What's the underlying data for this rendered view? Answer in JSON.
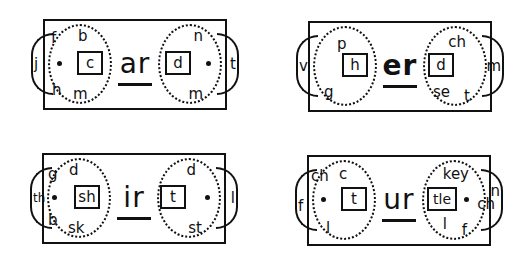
{
  "cards": [
    {
      "vowel": "ar",
      "left_tab": "j",
      "right_tab": "t",
      "left_box": "c",
      "right_box": "d",
      "left_letters": {
        "top_left": "f",
        "top_right": "b",
        "bottom_left": "h",
        "bottom_right": "m"
      },
      "right_letters": {
        "top": "n",
        "bottom": "m"
      }
    },
    {
      "vowel": "er",
      "left_tab": "v",
      "right_tab": "m",
      "left_box": "h",
      "right_box": "d",
      "left_letters": {
        "top": "p",
        "bottom": "g"
      },
      "right_letters": {
        "top": "ch",
        "bottom_left": "se",
        "bottom_right": "t"
      }
    },
    {
      "vowel": "ir",
      "left_tab": "th",
      "right_tab": "l",
      "left_box": "sh",
      "right_box": "t",
      "left_letters": {
        "top_left": "g",
        "top_right": "d",
        "bottom_left": "b",
        "bottom_right": "sk"
      },
      "right_letters": {
        "top": "d",
        "bottom": "st"
      }
    },
    {
      "vowel": "ur",
      "left_tab": "f",
      "right_tab": "n",
      "right_tab_extra": "ch",
      "left_box": "t",
      "right_box": "tle",
      "left_letters": {
        "top_left": "ch",
        "top_right": "c",
        "bottom": "l"
      },
      "right_letters": {
        "top": "key",
        "bottom_left": "l",
        "bottom_right": "f"
      }
    }
  ]
}
